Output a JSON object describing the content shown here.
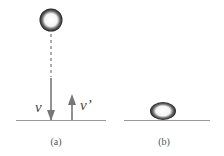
{
  "panels": [
    {
      "label": "(a)",
      "velocity_down": "v",
      "velocity_up": "v’"
    },
    {
      "label": "(b)"
    }
  ],
  "colors": {
    "ink": "#7a7a7a",
    "ball_dark": "#2a2a2a",
    "ground": "#8a8a8a"
  }
}
